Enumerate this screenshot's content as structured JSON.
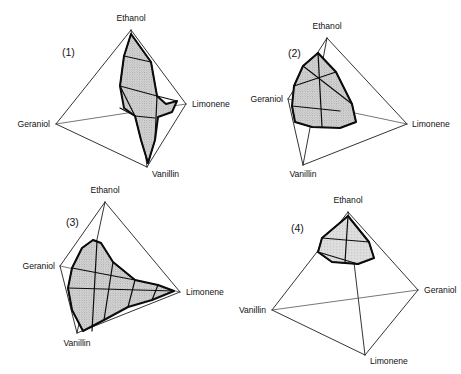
{
  "figure": {
    "type": "tetrahedral-phase-diagram-grid",
    "background_color": "#ffffff",
    "line_color": "#1d1d1d",
    "fill_color": "#c9c9c9",
    "width": 461,
    "height": 374,
    "panel_count": 4
  },
  "panels": [
    {
      "id": "panel-1",
      "number_label": "(1)",
      "number_pos": {
        "x": 62,
        "y": 56
      },
      "vertices": [
        {
          "name": "Ethanol",
          "x": 131,
          "y": 30,
          "label_x": 131,
          "label_y": 21,
          "anchor": "middle"
        },
        {
          "name": "Geraniol",
          "x": 56,
          "y": 124,
          "label_x": 50,
          "label_y": 127,
          "anchor": "end"
        },
        {
          "name": "Limonene",
          "x": 186,
          "y": 104,
          "label_x": 192,
          "label_y": 107,
          "anchor": "start"
        },
        {
          "name": "Vanillin",
          "x": 147,
          "y": 167,
          "label_x": 152,
          "label_y": 177,
          "anchor": "start"
        }
      ],
      "region_description": "tall vertical lens-shaped miscibility body spanning from Ethanol apex down to Vanillin vertex, bulging toward Limonene",
      "region_path": "M 131 34 L 151 62 L 157 96 L 166 104 L 177 101 L 172 112 L 158 117 L 155 140 L 148 163 L 141 140 L 135 116 L 124 108 L 120 86 L 124 56 Z",
      "region_inner_paths": [
        "M 131 34 L 124 56 L 120 86 L 135 116 L 141 140 L 148 163",
        "M 131 34 L 151 62 L 157 96 L 155 140 L 148 163",
        "M 120 86 L 157 96",
        "M 135 116 L 155 118",
        "M 124 56 L 151 62",
        "M 157 96 L 177 101",
        "M 135 116 L 120 108"
      ],
      "hatch_orientation": "vertical-dense"
    },
    {
      "id": "panel-2",
      "number_label": "(2)",
      "number_pos": {
        "x": 288,
        "y": 57
      },
      "vertices": [
        {
          "name": "Ethanol",
          "x": 327,
          "y": 38,
          "label_x": 327,
          "label_y": 29,
          "anchor": "middle"
        },
        {
          "name": "Geraniol",
          "x": 288,
          "y": 99,
          "label_x": 283,
          "label_y": 102,
          "anchor": "end"
        },
        {
          "name": "Limonene",
          "x": 407,
          "y": 124,
          "label_x": 412,
          "label_y": 127,
          "anchor": "start"
        },
        {
          "name": "Vanillin",
          "x": 303,
          "y": 165,
          "label_x": 303,
          "label_y": 177,
          "anchor": "middle"
        }
      ],
      "region_description": "compact shaded lobe filling the Geraniol-Ethanol corner region with a curved ridge sloping toward Limonene",
      "region_path": "M 318 53 L 336 72 L 352 104 L 356 122 L 340 128 L 312 127 L 295 122 L 292 106 L 294 86 L 303 66 Z",
      "region_inner_paths": [
        "M 318 53 L 303 66 L 294 86 L 292 106 L 295 122 L 312 127",
        "M 318 53 L 336 72 L 352 104 L 356 122 L 340 128",
        "M 292 106 L 340 111",
        "M 294 86 L 336 72",
        "M 318 53 L 322 127",
        "M 303 66 L 352 104"
      ],
      "hatch_orientation": "vertical-dense"
    },
    {
      "id": "panel-3",
      "number_label": "(3)",
      "number_pos": {
        "x": 66,
        "y": 226
      },
      "vertices": [
        {
          "name": "Ethanol",
          "x": 105,
          "y": 202,
          "label_x": 105,
          "label_y": 193,
          "anchor": "middle"
        },
        {
          "name": "Geraniol",
          "x": 60,
          "y": 266,
          "label_x": 55,
          "label_y": 269,
          "anchor": "end"
        },
        {
          "name": "Limonene",
          "x": 180,
          "y": 292,
          "label_x": 186,
          "label_y": 295,
          "anchor": "start"
        },
        {
          "name": "Vanillin",
          "x": 77,
          "y": 333,
          "label_x": 77,
          "label_y": 346,
          "anchor": "middle"
        }
      ],
      "region_description": "broad wing-shaped region stretching from a narrow spike below the Ethanol apex out to the Limonene vertex and down to Vanillin",
      "region_path": "M 93 240 L 101 243 L 113 262 L 135 280 L 158 285 L 174 291 L 152 300 L 128 307 L 104 320 L 83 331 L 72 310 L 68 288 L 72 268 L 82 248 Z",
      "region_inner_paths": [
        "M 93 240 L 82 248 L 72 268 L 68 288 L 72 310 L 83 331",
        "M 93 240 L 101 243 L 113 262 L 135 280 L 158 285 L 174 291",
        "M 68 288 L 174 291",
        "M 72 268 L 135 280",
        "M 97 241 L 92 331",
        "M 113 262 L 104 320",
        "M 135 280 L 128 307",
        "M 158 285 L 152 300"
      ],
      "hatch_orientation": "vertical-dense"
    },
    {
      "id": "panel-4",
      "number_label": "(4)",
      "number_pos": {
        "x": 291,
        "y": 232
      },
      "vertices": [
        {
          "name": "Ethanol",
          "x": 348,
          "y": 212,
          "label_x": 348,
          "label_y": 203,
          "anchor": "middle"
        },
        {
          "name": "Vanillin",
          "x": 272,
          "y": 310,
          "label_x": 266,
          "label_y": 313,
          "anchor": "end"
        },
        {
          "name": "Geraniol",
          "x": 418,
          "y": 290,
          "label_x": 424,
          "label_y": 293,
          "anchor": "start"
        },
        {
          "name": "Limonene",
          "x": 365,
          "y": 355,
          "label_x": 370,
          "label_y": 364,
          "anchor": "start"
        }
      ],
      "region_description": "small shaded prism clustered immediately beneath the Ethanol apex only",
      "region_path": "M 348 216 L 369 242 L 374 258 L 358 264 L 332 262 L 318 252 L 322 238 Z",
      "region_inner_paths": [
        "M 348 216 L 322 238 L 318 252 L 332 262",
        "M 348 216 L 369 242 L 374 258 L 358 264",
        "M 322 238 L 369 242",
        "M 318 252 L 358 264",
        "M 348 216 L 345 262",
        "M 332 262 L 358 264"
      ],
      "hatch_orientation": "light"
    }
  ]
}
